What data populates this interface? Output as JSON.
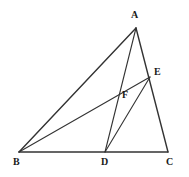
{
  "figure": {
    "kind": "euclidean-geometry-diagram",
    "background_color": "#ffffff",
    "stroke_color": "#333333",
    "label_color": "#1a1a1a",
    "canvas": {
      "width": 189,
      "height": 177
    }
  },
  "points": [
    {
      "id": "A",
      "label": "A",
      "x": 136,
      "y": 28,
      "label_x": 131,
      "label_y": 10
    },
    {
      "id": "B",
      "label": "B",
      "x": 19,
      "y": 152,
      "label_x": 13,
      "label_y": 157
    },
    {
      "id": "C",
      "label": "C",
      "x": 168,
      "y": 152,
      "label_x": 166,
      "label_y": 157
    },
    {
      "id": "D",
      "label": "D",
      "x": 105,
      "y": 152,
      "label_x": 101,
      "label_y": 157
    },
    {
      "id": "E",
      "label": "E",
      "x": 150,
      "y": 77,
      "label_x": 154,
      "label_y": 67
    },
    {
      "id": "F",
      "label": "F",
      "x": 120,
      "y": 97,
      "label_x": 122,
      "label_y": 90
    }
  ],
  "segments": [
    {
      "id": "AB",
      "from": "A",
      "to": "B",
      "role": "triangle-side",
      "width": 1.4
    },
    {
      "id": "BC",
      "from": "B",
      "to": "C",
      "role": "triangle-side",
      "width": 1.4
    },
    {
      "id": "AC",
      "from": "A",
      "to": "C",
      "role": "triangle-side",
      "width": 1.4
    },
    {
      "id": "AD",
      "from": "A",
      "to": "D",
      "role": "cevian",
      "width": 1.1
    },
    {
      "id": "BE",
      "from": "B",
      "to": "E",
      "role": "cevian",
      "width": 1.1
    },
    {
      "id": "DE",
      "from": "D",
      "to": "E",
      "role": "connector",
      "width": 1.1
    }
  ],
  "intersections": [
    {
      "id": "F",
      "of": [
        "AD",
        "BE"
      ],
      "label": "F"
    }
  ]
}
